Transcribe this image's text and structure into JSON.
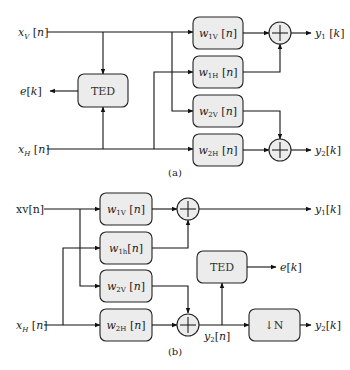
{
  "diagram_a": {
    "caption": "(a)",
    "inputs": {
      "xv": "x_V[n]",
      "xh": "x_H[n]"
    },
    "ted_label": "TED",
    "error_output": "e[k]",
    "filters": [
      {
        "main": "w",
        "sub": "1V",
        "arg": "[n]"
      },
      {
        "main": "w",
        "sub": "1H",
        "arg": "[n]"
      },
      {
        "main": "w",
        "sub": "2V",
        "arg": "[n]"
      },
      {
        "main": "w",
        "sub": "2H",
        "arg": "[n]"
      }
    ],
    "outputs": {
      "y1": "y_1[k]",
      "y2": "y_2[k]"
    }
  },
  "diagram_b": {
    "caption": "(b)",
    "inputs": {
      "xv": "xv[n]",
      "xh": "x_H[n]"
    },
    "filters": [
      {
        "main": "w",
        "sub": "1V",
        "arg": "[n]"
      },
      {
        "main": "w",
        "sub": "1h",
        "arg": "[n]"
      },
      {
        "main": "w",
        "sub": "2V",
        "arg": "[n]"
      },
      {
        "main": "w",
        "sub": "2H",
        "arg": "[n]"
      }
    ],
    "ted_label": "TED",
    "error_output": "e[k]",
    "downsample_label": "↓N",
    "intermediate": "y_2[n]",
    "outputs": {
      "y1": "y_1[k]",
      "y2": "y_2[k]"
    }
  }
}
